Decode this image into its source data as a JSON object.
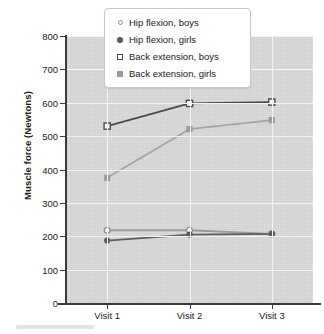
{
  "chart_data": {
    "type": "line",
    "title": "",
    "xlabel": "",
    "ylabel": "Muscle force (Newtons)",
    "categories": [
      "Visit 1",
      "Visit 2",
      "Visit 3"
    ],
    "ylim": [
      0,
      800
    ],
    "yticks": [
      0,
      100,
      200,
      300,
      400,
      500,
      600,
      700,
      800
    ],
    "ytick_labels": [
      "0",
      "100",
      "200",
      "300",
      "400",
      "500",
      "600",
      "700",
      "800"
    ],
    "grid": "horizontal-and-vertical white gridlines on gray panel",
    "legend_position": "top-center",
    "series": [
      {
        "name": "Hip flexion, boys",
        "marker": "open-circle",
        "color": "#8f8f8f",
        "line_color": "#9a9a9a",
        "values": [
          218,
          218,
          207
        ]
      },
      {
        "name": "Hip flexion, girls",
        "marker": "filled-circle",
        "color": "#585858",
        "line_color": "#5e5e5e",
        "values": [
          187,
          205,
          207
        ]
      },
      {
        "name": "Back extension, boys",
        "marker": "open-square",
        "color": "#4a4a4a",
        "line_color": "#4a4a4a",
        "values": [
          530,
          598,
          602
        ]
      },
      {
        "name": "Back extension, girls",
        "marker": "filled-square",
        "color": "#9a9a9a",
        "line_color": "#a5a5a5",
        "values": [
          375,
          521,
          548
        ]
      }
    ]
  },
  "legend": {
    "items": [
      {
        "label": "Hip flexion, boys",
        "marker": "open-circle"
      },
      {
        "label": "Hip flexion, girls",
        "marker": "filled-circle"
      },
      {
        "label": "Back extension, boys",
        "marker": "open-square"
      },
      {
        "label": "Back extension, girls",
        "marker": "filled-square"
      }
    ]
  },
  "colors": {
    "panel_background": "#d7d7d7",
    "gridline": "#f4f4f4",
    "axis": "#3a3a3a",
    "text": "#1a1a1a",
    "page_background": "#ffffff"
  }
}
